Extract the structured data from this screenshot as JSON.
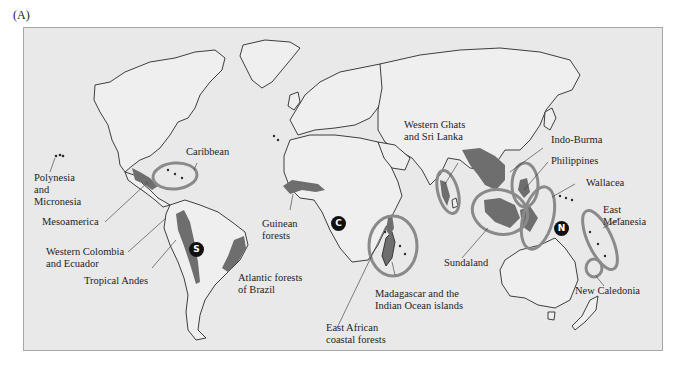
{
  "figure": {
    "panel_label": "(A)",
    "colors": {
      "ocean": "#e9e9e9",
      "land": "#efefef",
      "coast": "#2a2a2a",
      "hotspot_fill": "#6e6e6e",
      "hotspot_ring": "#8a8a8a",
      "frame_border": "#a6a6a6"
    }
  },
  "markers": [
    {
      "letter": "S",
      "meaning": "South America"
    },
    {
      "letter": "C",
      "meaning": "Africa"
    },
    {
      "letter": "N",
      "meaning": "New Guinea region"
    }
  ],
  "labels": {
    "polynesia": [
      "Polynesia",
      "and",
      "Micronesia"
    ],
    "caribbean": "Caribbean",
    "mesoamerica": "Mesoamerica",
    "western_colombia": [
      "Western Colombia",
      "and Ecuador"
    ],
    "tropical_andes": "Tropical Andes",
    "atlantic_forests": [
      "Atlantic forests",
      "of Brazil"
    ],
    "guinean": [
      "Guinean",
      "forests"
    ],
    "east_african": [
      "East African",
      "coastal forests"
    ],
    "madagascar": [
      "Madagascar and the",
      "Indian Ocean islands"
    ],
    "western_ghats": [
      "Western Ghats",
      "and Sri Lanka"
    ],
    "indo_burma": "Indo-Burma",
    "philippines": "Philippines",
    "wallacea": "Wallacea",
    "sundaland": "Sundaland",
    "east_melanesia": [
      "East",
      "Melanesia"
    ],
    "new_caledonia": "New Caledonia"
  }
}
